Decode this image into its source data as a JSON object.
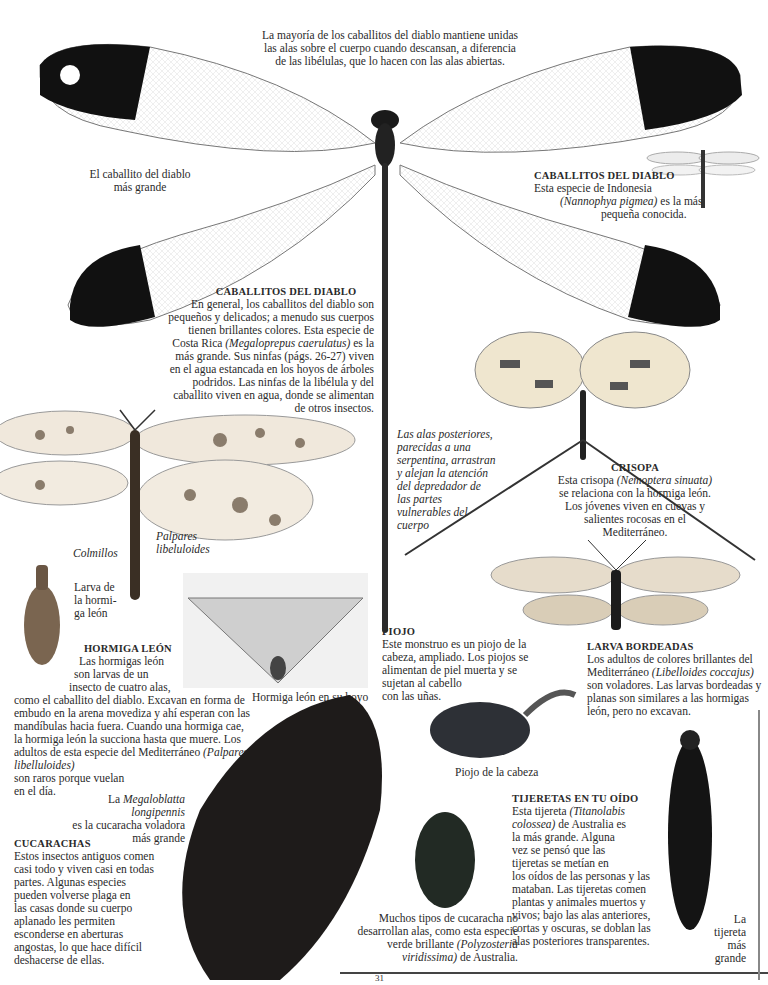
{
  "intro_caption": {
    "lines": [
      "La mayoría de los caballitos del diablo mantiene unidas",
      "las alas sobre el cuerpo cuando descansan, a diferencia",
      "de las libélulas, que lo hacen con las alas abiertas."
    ]
  },
  "largest_damselfly": {
    "label_lines": [
      "El caballito del diablo",
      "más grande"
    ]
  },
  "small_damselfly": {
    "heading": "CABALLITOS DEL DIABLO",
    "line1": "Esta especie de Indonesia",
    "species": "(Nannophya pigmea)",
    "line2_rest": " es la más",
    "line3": "pequeña conocida."
  },
  "damselflies": {
    "heading": "CABALLITOS DEL DIABLO",
    "body_before": "En general, los caballitos del diablo son pequeños y delicados; a menudo sus cuerpos tienen brillantes colores. Esta especie de Costa Rica ",
    "species": "(Megaloprepus caerulatus)",
    "body_after": " es la más grande. Sus ninfas (págs. 26-27) viven en el agua estancada en los hoyos de árboles podridos. Las ninfas de la libélula y del caballito viven en agua, donde se alimentan de otros insectos."
  },
  "hindwings_note": {
    "text": "Las alas posteriores, parecidas a una serpentina, arrastran y alejan la atención del depredador de las partes vulnerables del cuerpo"
  },
  "crisopa": {
    "heading": "CRISOPA",
    "body_before": "Esta crisopa ",
    "species": "(Nemoptera sinuata)",
    "body_after": " se relaciona con la hormiga león. Los jóvenes viven en cuevas y salientes rocosas en el Mediterráneo."
  },
  "antlion_adult": {
    "label_lines": [
      "Palpares",
      "libeluloides"
    ]
  },
  "antlion_larva": {
    "fangs_label": "Colmillos",
    "label_lines": [
      "Larva de",
      "la hormi-",
      "ga león"
    ]
  },
  "antlion_pit": {
    "caption": "Hormiga león en su hoyo"
  },
  "hormiga_leon": {
    "heading": "HORMIGA LEÓN",
    "lines_indented": [
      "Las hormigas león",
      "son larvas de un",
      "insecto de cuatro alas,"
    ],
    "body_before": "como el caballito del diablo. Excavan en forma de embudo en la arena movediza y ahí esperan con las mandíbulas hacia fuera. Cuando una hormiga cae, la hormiga león la succiona hasta que muere. Los adultos de esta especie del Mediterráneo ",
    "species": "(Palpares libelluloides)",
    "body_after_lines": [
      "son raros porque vuelan",
      "en el día."
    ]
  },
  "piojo": {
    "heading": "PIOJO",
    "lines": [
      "Este monstruo es un piojo de la",
      "cabeza, ampliado. Los piojos se",
      "alimentan de piel muerta y se",
      "sujetan al cabello",
      "con las uñas."
    ],
    "caption": "Piojo de la cabeza"
  },
  "larva_bordeadas": {
    "heading": "LARVA BORDEADAS",
    "body_before": "Los adultos de colores brillantes del Mediterráneo ",
    "species": "(Libelloides coccajus)",
    "body_after": " son voladores. Las larvas bordeadas y planas son similares a las hormigas león, pero no excavan."
  },
  "flying_roach": {
    "prefix": "La ",
    "species": "Megaloblatta longipennis",
    "line2": "es la cucaracha voladora",
    "line3": "más grande"
  },
  "cucarachas": {
    "heading": "CUCARACHAS",
    "lines": [
      "Estos insectos antiguos comen",
      "casi todo y viven casi en todas",
      "partes. Algunas especies",
      "pueden volverse plaga en",
      "las casas donde su cuerpo",
      "aplanado les permiten",
      "esconderse en aberturas",
      "angostas, lo que hace difícil",
      "deshacerse de ellas."
    ]
  },
  "wingless_roach": {
    "line1": "Muchos tipos de cucaracha no",
    "line2": "desarrollan alas, como esta especie",
    "line3_before": "verde brillante ",
    "species_a": "(Polyzosteria",
    "species_b": "viridissima)",
    "line4_after": " de Australia."
  },
  "tijeretas": {
    "heading": "TIJERETAS EN TU OÍDO",
    "line1_before": "Esta tijereta ",
    "species_a": "(Titanolabis",
    "species_b": "colossea)",
    "line2_after": " de Australia es",
    "lines_rest": [
      "la más grande. Alguna",
      "vez se pensó que las",
      "tijeretas se metían en",
      "los oídos de las personas y las",
      "mataban. Las tijeretas comen",
      "plantas y animales muertos y",
      "vivos; bajo las alas anteriores,",
      "cortas y oscuras, se doblan las",
      "alas posteriores transparentes."
    ]
  },
  "earwig_label": {
    "lines": [
      "La",
      "tijereta",
      "más",
      "grande"
    ]
  },
  "page_number": "31"
}
